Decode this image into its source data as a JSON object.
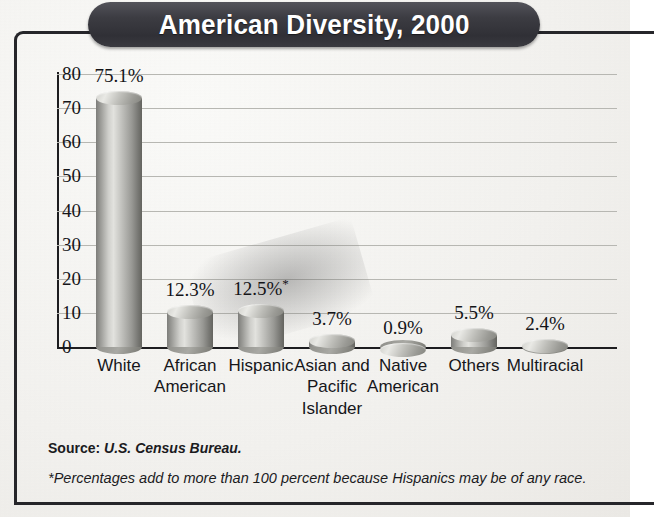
{
  "title": "American Diversity, 2000",
  "chart_data": {
    "type": "bar",
    "title": "American Diversity, 2000",
    "xlabel": "",
    "ylabel": "Percent of Total Population",
    "ylim": [
      0,
      80
    ],
    "ytick_step": 10,
    "yticks": [
      "80",
      "70",
      "60",
      "50",
      "40",
      "30",
      "20",
      "10",
      "0"
    ],
    "grid": true,
    "legend": "none",
    "categories": [
      "White",
      "African American",
      "Hispanic",
      "Asian and Pacific Islander",
      "Native American",
      "Others",
      "Multiracial"
    ],
    "category_lines": [
      [
        "White"
      ],
      [
        "African",
        "American"
      ],
      [
        "Hispanic"
      ],
      [
        "Asian and",
        "Pacific",
        "Islander"
      ],
      [
        "Native",
        "American"
      ],
      [
        "Others"
      ],
      [
        "Multiracial"
      ]
    ],
    "values": [
      75.1,
      12.3,
      12.5,
      3.7,
      0.9,
      5.5,
      2.4
    ],
    "data_labels": [
      "75.1%",
      "12.3%",
      "12.5%*",
      "3.7%",
      "0.9%",
      "5.5%",
      "2.4%"
    ],
    "annotations": [
      "*Percentages add to more than 100 percent because Hispanics may be of any race."
    ]
  },
  "source": {
    "label": "Source:",
    "value": "U.S. Census Bureau."
  },
  "footnote": "*Percentages add to more than 100 percent because Hispanics may be of any race.",
  "colors": {
    "banner": "#3a3a40",
    "banner_text": "#ffffff",
    "frame": "#26262a",
    "gridline": "#b7b7b2",
    "axis": "#1d1d20",
    "bar_light": "#e2e2de",
    "bar_dark": "#64645f",
    "background": "#f3f2ef",
    "text": "#16161a"
  }
}
